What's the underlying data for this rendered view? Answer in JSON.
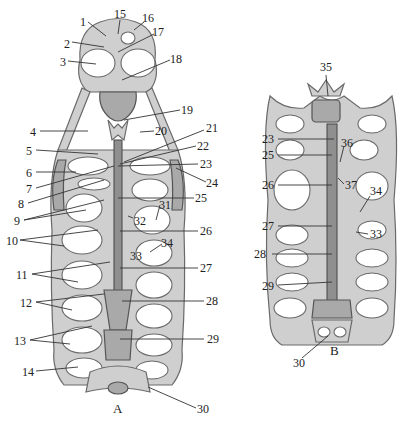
{
  "figure": {
    "panels": [
      {
        "id": "A",
        "label": "A"
      },
      {
        "id": "B",
        "label": "B"
      }
    ],
    "colors": {
      "bone": "#cfcfcf",
      "bone_shadow": "#a9a9a9",
      "outline": "#6a6a6a",
      "background": "#ffffff",
      "text": "#222222"
    }
  },
  "labels_A_left": [
    {
      "n": "1",
      "x": 80,
      "y": 16
    },
    {
      "n": "2",
      "x": 64,
      "y": 38
    },
    {
      "n": "3",
      "x": 60,
      "y": 56
    },
    {
      "n": "4",
      "x": 30,
      "y": 126
    },
    {
      "n": "5",
      "x": 26,
      "y": 145
    },
    {
      "n": "6",
      "x": 26,
      "y": 167
    },
    {
      "n": "7",
      "x": 26,
      "y": 183
    },
    {
      "n": "8",
      "x": 18,
      "y": 198
    },
    {
      "n": "9",
      "x": 14,
      "y": 217
    },
    {
      "n": "10",
      "x": 6,
      "y": 235
    },
    {
      "n": "11",
      "x": 16,
      "y": 269
    },
    {
      "n": "12",
      "x": 20,
      "y": 297
    },
    {
      "n": "13",
      "x": 14,
      "y": 335
    },
    {
      "n": "14",
      "x": 22,
      "y": 366
    }
  ],
  "labels_A_right": [
    {
      "n": "15",
      "x": 114,
      "y": 9
    },
    {
      "n": "16",
      "x": 142,
      "y": 13
    },
    {
      "n": "17",
      "x": 152,
      "y": 27
    },
    {
      "n": "18",
      "x": 170,
      "y": 53
    },
    {
      "n": "19",
      "x": 181,
      "y": 104
    },
    {
      "n": "20",
      "x": 155,
      "y": 126
    },
    {
      "n": "21",
      "x": 206,
      "y": 124
    },
    {
      "n": "22",
      "x": 197,
      "y": 141
    },
    {
      "n": "23",
      "x": 200,
      "y": 159
    },
    {
      "n": "24",
      "x": 206,
      "y": 178
    },
    {
      "n": "25",
      "x": 195,
      "y": 193
    },
    {
      "n": "26",
      "x": 200,
      "y": 226
    },
    {
      "n": "27",
      "x": 200,
      "y": 263
    },
    {
      "n": "28",
      "x": 206,
      "y": 296
    },
    {
      "n": "29",
      "x": 207,
      "y": 334
    },
    {
      "n": "30",
      "x": 197,
      "y": 404
    },
    {
      "n": "31",
      "x": 159,
      "y": 200
    },
    {
      "n": "32",
      "x": 134,
      "y": 216
    },
    {
      "n": "33",
      "x": 130,
      "y": 250
    },
    {
      "n": "34",
      "x": 161,
      "y": 238
    }
  ],
  "labels_B": [
    {
      "n": "35",
      "x": 320,
      "y": 62
    },
    {
      "n": "23",
      "x": 262,
      "y": 134
    },
    {
      "n": "25",
      "x": 262,
      "y": 150
    },
    {
      "n": "36",
      "x": 341,
      "y": 138
    },
    {
      "n": "37",
      "x": 345,
      "y": 180
    },
    {
      "n": "26",
      "x": 262,
      "y": 180
    },
    {
      "n": "34",
      "x": 370,
      "y": 186
    },
    {
      "n": "27",
      "x": 262,
      "y": 221
    },
    {
      "n": "33",
      "x": 370,
      "y": 229
    },
    {
      "n": "28",
      "x": 254,
      "y": 249
    },
    {
      "n": "29",
      "x": 262,
      "y": 281
    },
    {
      "n": "30",
      "x": 293,
      "y": 358
    }
  ],
  "panel_labels": [
    {
      "text": "A",
      "x": 113,
      "y": 404
    },
    {
      "text": "B",
      "x": 330,
      "y": 346
    }
  ]
}
